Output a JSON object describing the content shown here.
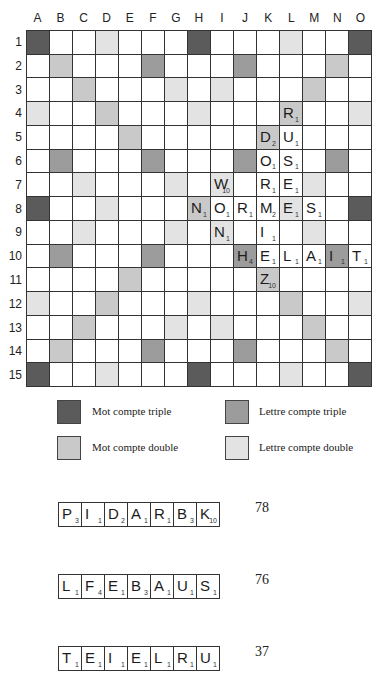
{
  "board": {
    "columns": [
      "A",
      "B",
      "C",
      "D",
      "E",
      "F",
      "G",
      "H",
      "I",
      "J",
      "K",
      "L",
      "M",
      "N",
      "O"
    ],
    "rows": [
      "1",
      "2",
      "3",
      "4",
      "5",
      "6",
      "7",
      "8",
      "9",
      "10",
      "11",
      "12",
      "13",
      "14",
      "15"
    ],
    "premium": [
      [
        "TW",
        "",
        "",
        "DL",
        "",
        "",
        "",
        "TW",
        "",
        "",
        "",
        "DL",
        "",
        "",
        "TW"
      ],
      [
        "",
        "DW",
        "",
        "",
        "",
        "TL",
        "",
        "",
        "",
        "TL",
        "",
        "",
        "",
        "DW",
        ""
      ],
      [
        "",
        "",
        "DW",
        "",
        "",
        "",
        "DL",
        "",
        "DL",
        "",
        "",
        "",
        "DW",
        "",
        ""
      ],
      [
        "DL",
        "",
        "",
        "DW",
        "",
        "",
        "",
        "DL",
        "",
        "",
        "",
        "DW",
        "",
        "",
        "DL"
      ],
      [
        "",
        "",
        "",
        "",
        "DW",
        "",
        "",
        "",
        "",
        "",
        "DW",
        "",
        "",
        "",
        ""
      ],
      [
        "",
        "TL",
        "",
        "",
        "",
        "TL",
        "",
        "",
        "",
        "TL",
        "",
        "",
        "",
        "TL",
        ""
      ],
      [
        "",
        "",
        "DL",
        "",
        "",
        "",
        "DL",
        "",
        "DL",
        "",
        "",
        "",
        "DL",
        "",
        ""
      ],
      [
        "TW",
        "",
        "",
        "DL",
        "",
        "",
        "",
        "DW",
        "",
        "",
        "",
        "DL",
        "",
        "",
        "TW"
      ],
      [
        "",
        "",
        "DL",
        "",
        "",
        "",
        "DL",
        "",
        "DL",
        "",
        "",
        "",
        "DL",
        "",
        ""
      ],
      [
        "",
        "TL",
        "",
        "",
        "",
        "TL",
        "",
        "",
        "",
        "TL",
        "",
        "",
        "",
        "TL",
        ""
      ],
      [
        "",
        "",
        "",
        "",
        "DW",
        "",
        "",
        "",
        "",
        "",
        "DW",
        "",
        "",
        "",
        ""
      ],
      [
        "DL",
        "",
        "",
        "DW",
        "",
        "",
        "",
        "DL",
        "",
        "",
        "",
        "DW",
        "",
        "",
        "DL"
      ],
      [
        "",
        "",
        "DW",
        "",
        "",
        "",
        "DL",
        "",
        "DL",
        "",
        "",
        "",
        "DW",
        "",
        ""
      ],
      [
        "",
        "DW",
        "",
        "",
        "",
        "TL",
        "",
        "",
        "",
        "TL",
        "",
        "",
        "",
        "DW",
        ""
      ],
      [
        "TW",
        "",
        "",
        "DL",
        "",
        "",
        "",
        "TW",
        "",
        "",
        "",
        "DL",
        "",
        "",
        "TW"
      ]
    ],
    "tiles": [
      {
        "row": 4,
        "col": "L",
        "letter": "R",
        "points": "1"
      },
      {
        "row": 5,
        "col": "K",
        "letter": "D",
        "points": "2"
      },
      {
        "row": 5,
        "col": "L",
        "letter": "U",
        "points": "1"
      },
      {
        "row": 6,
        "col": "K",
        "letter": "O",
        "points": "1"
      },
      {
        "row": 6,
        "col": "L",
        "letter": "S",
        "points": "1"
      },
      {
        "row": 7,
        "col": "I",
        "letter": "W",
        "points": "10"
      },
      {
        "row": 7,
        "col": "K",
        "letter": "R",
        "points": "1"
      },
      {
        "row": 7,
        "col": "L",
        "letter": "E",
        "points": "1"
      },
      {
        "row": 8,
        "col": "H",
        "letter": "N",
        "points": "1"
      },
      {
        "row": 8,
        "col": "I",
        "letter": "O",
        "points": "1"
      },
      {
        "row": 8,
        "col": "J",
        "letter": "R",
        "points": "1"
      },
      {
        "row": 8,
        "col": "K",
        "letter": "M",
        "points": "2"
      },
      {
        "row": 8,
        "col": "L",
        "letter": "E",
        "points": "1"
      },
      {
        "row": 8,
        "col": "M",
        "letter": "S",
        "points": "1"
      },
      {
        "row": 9,
        "col": "I",
        "letter": "N",
        "points": "1"
      },
      {
        "row": 9,
        "col": "K",
        "letter": "I",
        "points": "1"
      },
      {
        "row": 10,
        "col": "J",
        "letter": "H",
        "points": "4"
      },
      {
        "row": 10,
        "col": "K",
        "letter": "E",
        "points": "1"
      },
      {
        "row": 10,
        "col": "L",
        "letter": "L",
        "points": "1"
      },
      {
        "row": 10,
        "col": "M",
        "letter": "A",
        "points": "1"
      },
      {
        "row": 10,
        "col": "N",
        "letter": "I",
        "points": "1"
      },
      {
        "row": 10,
        "col": "O",
        "letter": "T",
        "points": "1"
      },
      {
        "row": 11,
        "col": "K",
        "letter": "Z",
        "points": "10"
      }
    ]
  },
  "colors": {
    "TW": "#5b5b5b",
    "TL": "#9c9c9c",
    "DW": "#c9c9c9",
    "DL": "#e3e3e3"
  },
  "legend": {
    "mot_triple": "Mot compte triple",
    "lettre_triple": "Lettre compte triple",
    "mot_double": "Mot compte double",
    "lettre_double": "Lettre compte double"
  },
  "racks": [
    {
      "tiles": [
        {
          "letter": "P",
          "points": "3"
        },
        {
          "letter": "I",
          "points": "1"
        },
        {
          "letter": "D",
          "points": "2"
        },
        {
          "letter": "A",
          "points": "1"
        },
        {
          "letter": "R",
          "points": "1"
        },
        {
          "letter": "B",
          "points": "3"
        },
        {
          "letter": "K",
          "points": "10"
        }
      ],
      "score": "78"
    },
    {
      "tiles": [
        {
          "letter": "L",
          "points": "1"
        },
        {
          "letter": "F",
          "points": "4"
        },
        {
          "letter": "E",
          "points": "1"
        },
        {
          "letter": "B",
          "points": "3"
        },
        {
          "letter": "A",
          "points": "1"
        },
        {
          "letter": "U",
          "points": "1"
        },
        {
          "letter": "S",
          "points": "1"
        }
      ],
      "score": "76"
    },
    {
      "tiles": [
        {
          "letter": "T",
          "points": "1"
        },
        {
          "letter": "E",
          "points": "1"
        },
        {
          "letter": "I",
          "points": "1"
        },
        {
          "letter": "E",
          "points": "1"
        },
        {
          "letter": "L",
          "points": "1"
        },
        {
          "letter": "R",
          "points": "1"
        },
        {
          "letter": "U",
          "points": "1"
        }
      ],
      "score": "37"
    }
  ]
}
